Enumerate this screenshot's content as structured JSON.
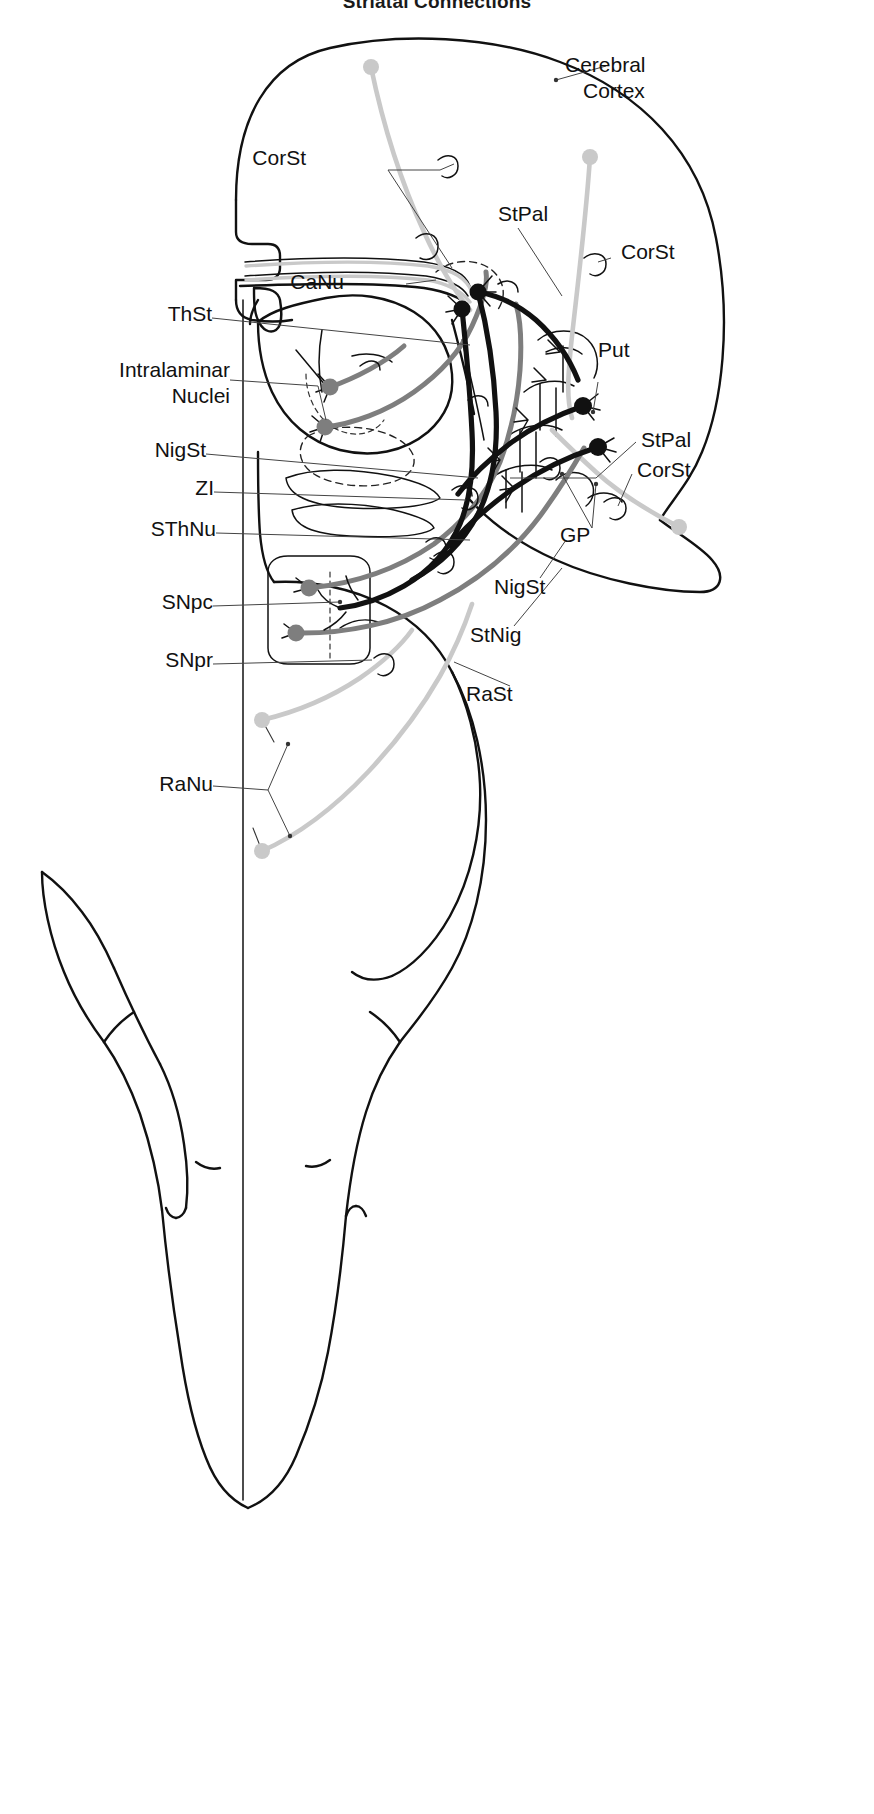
{
  "figure": {
    "title": "Striatal Connections",
    "type": "neuroanatomy-schematic",
    "view": "sagittal-section"
  },
  "labels_left": [
    {
      "id": "CorSt",
      "text": "CorSt",
      "x": 306,
      "y": 156,
      "anchor": "left-start"
    },
    {
      "id": "CaNu",
      "text": "CaNu",
      "x": 344,
      "y": 280,
      "anchor": "left-start"
    },
    {
      "id": "ThSt",
      "text": "ThSt",
      "x": 159,
      "y": 312,
      "anchor": "left-start"
    },
    {
      "id": "Intra1",
      "text": "Intralaminar",
      "x": 84,
      "y": 368,
      "anchor": "left-start"
    },
    {
      "id": "Intra2",
      "text": "Nuclei",
      "x": 143,
      "y": 394,
      "anchor": "left-start"
    },
    {
      "id": "NigSt",
      "text": "NigSt",
      "x": 148,
      "y": 448,
      "anchor": "left-start"
    },
    {
      "id": "ZI",
      "text": "ZI",
      "x": 190,
      "y": 486,
      "anchor": "left-start"
    },
    {
      "id": "SThNu",
      "text": "SThNu",
      "x": 139,
      "y": 527,
      "anchor": "left-start"
    },
    {
      "id": "SNpc",
      "text": "SNpc",
      "x": 156,
      "y": 600,
      "anchor": "left-start"
    },
    {
      "id": "SNpr",
      "text": "SNpr",
      "x": 156,
      "y": 658,
      "anchor": "left-start"
    },
    {
      "id": "RaNu",
      "text": "RaNu",
      "x": 155,
      "y": 780,
      "anchor": "left-start"
    }
  ],
  "labels_right": [
    {
      "id": "CerebralCortex1",
      "text": "Cerebral",
      "x": 565,
      "y": 63,
      "anchor": "right-start"
    },
    {
      "id": "CerebralCortex2",
      "text": "Cortex",
      "x": 583,
      "y": 89,
      "anchor": "right-start"
    },
    {
      "id": "StPalTop",
      "text": "StPal",
      "x": 498,
      "y": 212,
      "anchor": "right-start"
    },
    {
      "id": "CorStRightTop",
      "text": "CorSt",
      "x": 621,
      "y": 250,
      "anchor": "right-start"
    },
    {
      "id": "Put",
      "text": "Put",
      "x": 598,
      "y": 348,
      "anchor": "right-start"
    },
    {
      "id": "StPalRight",
      "text": "StPal",
      "x": 641,
      "y": 438,
      "anchor": "right-start"
    },
    {
      "id": "CorStRightLow",
      "text": "CorSt",
      "x": 637,
      "y": 468,
      "anchor": "right-start"
    },
    {
      "id": "GP",
      "text": "GP",
      "x": 560,
      "y": 533,
      "anchor": "right-start"
    },
    {
      "id": "NigStRight",
      "text": "NigSt",
      "x": 494,
      "y": 585,
      "anchor": "right-start"
    },
    {
      "id": "StNig",
      "text": "StNig",
      "x": 470,
      "y": 633,
      "anchor": "right-start"
    },
    {
      "id": "RaSt",
      "text": "RaSt",
      "x": 466,
      "y": 692,
      "anchor": "right-start"
    }
  ],
  "abbreviations": {
    "CorSt": "corticostriatal",
    "CaNu": "caudate nucleus",
    "ThSt": "thalamostriatal",
    "NigSt": "nigrostriatal",
    "ZI": "zona incerta",
    "SThNu": "subthalamic nucleus",
    "SNpc": "substantia nigra pars compacta",
    "SNpr": "substantia nigra pars reticulata",
    "RaNu": "raphe nuclei",
    "Put": "putamen",
    "StPal": "striatopallidal",
    "GP": "globus pallidus",
    "StNig": "striatonigral",
    "RaSt": "raphestriatal"
  },
  "colors": {
    "outline": "#111111",
    "tract_dark": "#111111",
    "tract_mid": "#7e7e7e",
    "tract_light": "#c9c9c9",
    "background": "#ffffff",
    "label_text": "#111111",
    "leader_line": "#444444"
  },
  "neuron_somata": [
    {
      "id": "soma-canu-1",
      "x": 478,
      "y": 292,
      "shade": "dark"
    },
    {
      "id": "soma-canu-2",
      "x": 462,
      "y": 309,
      "shade": "dark"
    },
    {
      "id": "soma-put-1",
      "x": 583,
      "y": 406,
      "shade": "dark"
    },
    {
      "id": "soma-put-2",
      "x": 598,
      "y": 447,
      "shade": "dark"
    },
    {
      "id": "soma-thal-1",
      "x": 330,
      "y": 387,
      "shade": "mid"
    },
    {
      "id": "soma-thal-2",
      "x": 325,
      "y": 427,
      "shade": "mid"
    },
    {
      "id": "soma-snpc-1",
      "x": 309,
      "y": 588,
      "shade": "mid"
    },
    {
      "id": "soma-snpc-2",
      "x": 296,
      "y": 633,
      "shade": "mid"
    },
    {
      "id": "soma-ctx-1",
      "x": 371,
      "y": 67,
      "shade": "light"
    },
    {
      "id": "soma-ctx-2",
      "x": 590,
      "y": 157,
      "shade": "light"
    },
    {
      "id": "soma-ctx-3",
      "x": 679,
      "y": 527,
      "shade": "light"
    },
    {
      "id": "soma-raphe-1",
      "x": 262,
      "y": 720,
      "shade": "light"
    },
    {
      "id": "soma-raphe-2",
      "x": 262,
      "y": 851,
      "shade": "light"
    }
  ],
  "pathways": [
    {
      "name": "corticostriatal",
      "abbrev": "CorSt",
      "shade": "light"
    },
    {
      "name": "thalamostriatal",
      "abbrev": "ThSt",
      "shade": "mid"
    },
    {
      "name": "nigrostriatal",
      "abbrev": "NigSt",
      "shade": "mid"
    },
    {
      "name": "raphestriatal",
      "abbrev": "RaSt",
      "shade": "light"
    },
    {
      "name": "striatopallidal",
      "abbrev": "StPal",
      "shade": "dark"
    },
    {
      "name": "striatonigral",
      "abbrev": "StNig",
      "shade": "dark"
    }
  ]
}
